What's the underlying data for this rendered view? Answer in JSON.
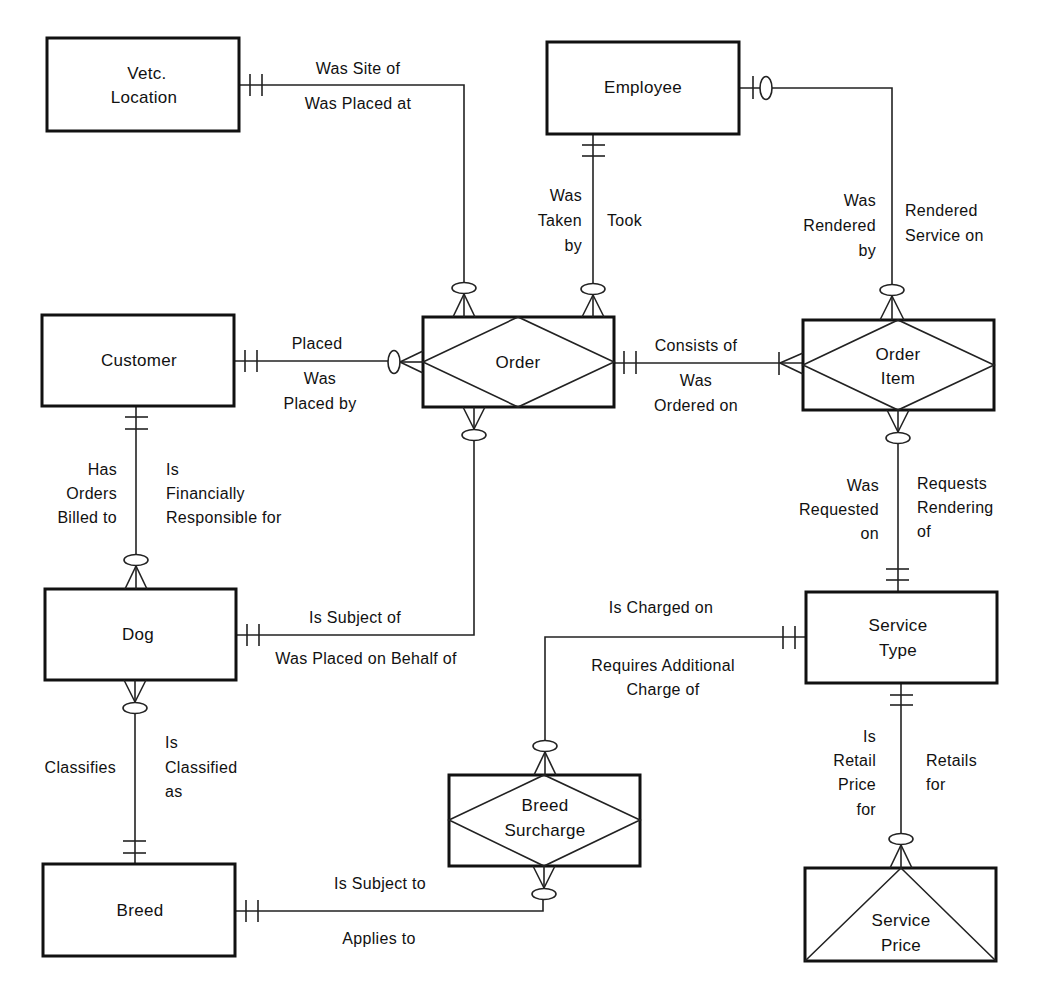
{
  "diagram": {
    "type": "entity-relationship",
    "notation": "crow's foot",
    "entities": [
      {
        "id": "vetc_location",
        "lines": [
          "Vetc.",
          "Location"
        ],
        "kind": "fundamental"
      },
      {
        "id": "employee",
        "lines": [
          "Employee"
        ],
        "kind": "fundamental"
      },
      {
        "id": "customer",
        "lines": [
          "Customer"
        ],
        "kind": "fundamental"
      },
      {
        "id": "order",
        "lines": [
          "Order"
        ],
        "kind": "associative"
      },
      {
        "id": "order_item",
        "lines": [
          "Order",
          "Item"
        ],
        "kind": "associative"
      },
      {
        "id": "dog",
        "lines": [
          "Dog"
        ],
        "kind": "fundamental"
      },
      {
        "id": "service_type",
        "lines": [
          "Service",
          "Type"
        ],
        "kind": "fundamental"
      },
      {
        "id": "breed_surcharge",
        "lines": [
          "Breed",
          "Surcharge"
        ],
        "kind": "associative"
      },
      {
        "id": "breed",
        "lines": [
          "Breed"
        ],
        "kind": "fundamental"
      },
      {
        "id": "service_price",
        "lines": [
          "Service",
          "Price"
        ],
        "kind": "attributive"
      }
    ],
    "relationships": [
      {
        "id": "r1",
        "from": "vetc_location",
        "to": "order",
        "from_card": "one-and-only-one",
        "to_card": "zero-or-many",
        "labels": {
          "a": [
            "Was Site of"
          ],
          "b": [
            "Was Placed at"
          ]
        }
      },
      {
        "id": "r2",
        "from": "employee",
        "to": "order",
        "from_card": "one-and-only-one",
        "to_card": "zero-or-many",
        "labels": {
          "a": [
            "Was",
            "Taken",
            "by"
          ],
          "b": [
            "Took"
          ]
        }
      },
      {
        "id": "r3",
        "from": "employee",
        "to": "order_item",
        "from_card": "zero-or-one",
        "to_card": "zero-or-many",
        "labels": {
          "a": [
            "Was",
            "Rendered",
            "by"
          ],
          "b": [
            "Rendered",
            "Service on"
          ]
        }
      },
      {
        "id": "r4",
        "from": "customer",
        "to": "order",
        "from_card": "one-and-only-one",
        "to_card": "zero-or-many",
        "labels": {
          "a": [
            "Placed"
          ],
          "b": [
            "Was",
            "Placed by"
          ]
        }
      },
      {
        "id": "r5",
        "from": "order",
        "to": "order_item",
        "from_card": "one-and-only-one",
        "to_card": "one-or-many",
        "labels": {
          "a": [
            "Consists of"
          ],
          "b": [
            "Was",
            "Ordered on"
          ]
        }
      },
      {
        "id": "r6",
        "from": "customer",
        "to": "dog",
        "from_card": "one-and-only-one",
        "to_card": "zero-or-many",
        "labels": {
          "a": [
            "Has",
            "Orders",
            "Billed to"
          ],
          "b": [
            "Is",
            "Financially",
            "Responsible for"
          ]
        }
      },
      {
        "id": "r7",
        "from": "order_item",
        "to": "service_type",
        "from_card": "zero-or-many",
        "to_card": "one-and-only-one",
        "labels": {
          "a": [
            "Was",
            "Requested",
            "on"
          ],
          "b": [
            "Requests",
            "Rendering",
            "of"
          ]
        }
      },
      {
        "id": "r8",
        "from": "dog",
        "to": "order",
        "from_card": "one-and-only-one",
        "to_card": "zero-or-many",
        "labels": {
          "a": [
            "Is Subject of"
          ],
          "b": [
            "Was Placed on Behalf of"
          ]
        }
      },
      {
        "id": "r9",
        "from": "service_type",
        "to": "breed_surcharge",
        "from_card": "one-and-only-one",
        "to_card": "zero-or-many",
        "labels": {
          "a": [
            "Is Charged on"
          ],
          "b": [
            "Requires Additional",
            "Charge of"
          ]
        }
      },
      {
        "id": "r10",
        "from": "dog",
        "to": "breed",
        "from_card": "zero-or-many",
        "to_card": "one-and-only-one",
        "labels": {
          "a": [
            "Classifies"
          ],
          "b": [
            "Is",
            "Classified",
            "as"
          ]
        }
      },
      {
        "id": "r11",
        "from": "service_type",
        "to": "service_price",
        "from_card": "one-and-only-one",
        "to_card": "zero-or-many",
        "labels": {
          "a": [
            "Is",
            "Retail",
            "Price",
            "for"
          ],
          "b": [
            "Retails",
            "for"
          ]
        }
      },
      {
        "id": "r12",
        "from": "breed",
        "to": "breed_surcharge",
        "from_card": "one-and-only-one",
        "to_card": "zero-or-many",
        "labels": {
          "a": [
            "Is Subject to"
          ],
          "b": [
            "Applies to"
          ]
        }
      }
    ]
  }
}
